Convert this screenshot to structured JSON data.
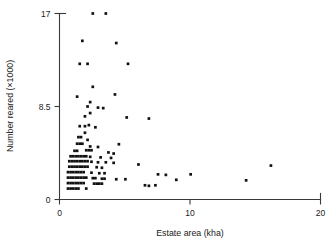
{
  "chart_data": {
    "type": "scatter",
    "title": "",
    "xlabel": "Estate area (kha)",
    "ylabel": "Number reared (×1000)",
    "xlim": [
      0,
      20
    ],
    "ylim": [
      0,
      17
    ],
    "xticks": [
      0,
      10,
      20
    ],
    "xticklabels": [
      "0",
      "10",
      "20"
    ],
    "yticks": [
      0,
      8.5,
      17
    ],
    "yticklabels": [
      "0",
      "8.5",
      "17"
    ],
    "grid": false,
    "legend": null,
    "marker": "square",
    "marker_color": "#111111",
    "points": [
      [
        2.55,
        17.0
      ],
      [
        3.55,
        17.0
      ],
      [
        1.75,
        14.5
      ],
      [
        4.35,
        14.3
      ],
      [
        1.55,
        12.4
      ],
      [
        2.15,
        12.4
      ],
      [
        5.25,
        12.4
      ],
      [
        2.55,
        10.3
      ],
      [
        1.35,
        9.4
      ],
      [
        4.25,
        9.6
      ],
      [
        2.35,
        8.9
      ],
      [
        2.15,
        8.5
      ],
      [
        2.95,
        8.4
      ],
      [
        3.35,
        8.35
      ],
      [
        2.35,
        7.9
      ],
      [
        1.95,
        7.6
      ],
      [
        5.15,
        7.5
      ],
      [
        6.85,
        7.4
      ],
      [
        1.55,
        6.7
      ],
      [
        1.95,
        6.7
      ],
      [
        2.25,
        6.8
      ],
      [
        2.75,
        6.6
      ],
      [
        1.95,
        6.1
      ],
      [
        1.45,
        5.7
      ],
      [
        1.65,
        5.7
      ],
      [
        2.15,
        5.45
      ],
      [
        1.35,
        5.1
      ],
      [
        1.55,
        5.1
      ],
      [
        1.75,
        5.1
      ],
      [
        4.55,
        5.05
      ],
      [
        2.35,
        4.85
      ],
      [
        2.95,
        4.8
      ],
      [
        1.15,
        4.45
      ],
      [
        1.35,
        4.45
      ],
      [
        2.05,
        4.5
      ],
      [
        2.25,
        4.5
      ],
      [
        2.45,
        4.5
      ],
      [
        3.75,
        4.3
      ],
      [
        4.15,
        4.2
      ],
      [
        0.85,
        3.95
      ],
      [
        1.05,
        3.95
      ],
      [
        1.25,
        3.95
      ],
      [
        1.45,
        3.95
      ],
      [
        1.65,
        3.95
      ],
      [
        1.85,
        3.95
      ],
      [
        2.05,
        3.95
      ],
      [
        2.35,
        3.9
      ],
      [
        3.15,
        3.85
      ],
      [
        3.95,
        3.8
      ],
      [
        0.75,
        3.5
      ],
      [
        0.95,
        3.5
      ],
      [
        1.15,
        3.5
      ],
      [
        1.35,
        3.5
      ],
      [
        1.55,
        3.5
      ],
      [
        1.75,
        3.5
      ],
      [
        1.95,
        3.5
      ],
      [
        2.15,
        3.5
      ],
      [
        2.45,
        3.45
      ],
      [
        2.95,
        3.4
      ],
      [
        3.55,
        3.4
      ],
      [
        4.15,
        3.35
      ],
      [
        6.05,
        3.2
      ],
      [
        0.75,
        3.0
      ],
      [
        0.95,
        3.0
      ],
      [
        1.15,
        3.0
      ],
      [
        1.35,
        3.0
      ],
      [
        1.55,
        3.0
      ],
      [
        1.75,
        3.0
      ],
      [
        1.95,
        3.0
      ],
      [
        2.15,
        3.0
      ],
      [
        2.85,
        2.95
      ],
      [
        3.25,
        2.9
      ],
      [
        16.2,
        3.1
      ],
      [
        0.65,
        2.5
      ],
      [
        0.85,
        2.5
      ],
      [
        1.05,
        2.5
      ],
      [
        1.25,
        2.5
      ],
      [
        1.45,
        2.5
      ],
      [
        1.65,
        2.5
      ],
      [
        1.85,
        2.5
      ],
      [
        2.45,
        2.45
      ],
      [
        3.05,
        2.4
      ],
      [
        3.45,
        2.4
      ],
      [
        7.55,
        2.3
      ],
      [
        8.15,
        2.25
      ],
      [
        10.05,
        2.3
      ],
      [
        0.65,
        2.0
      ],
      [
        0.85,
        2.0
      ],
      [
        1.05,
        2.0
      ],
      [
        1.25,
        2.0
      ],
      [
        1.45,
        2.0
      ],
      [
        1.65,
        2.0
      ],
      [
        1.85,
        2.0
      ],
      [
        2.05,
        2.0
      ],
      [
        2.55,
        1.95
      ],
      [
        2.75,
        1.95
      ],
      [
        3.25,
        1.9
      ],
      [
        3.45,
        1.9
      ],
      [
        4.35,
        1.85
      ],
      [
        5.05,
        1.85
      ],
      [
        8.95,
        1.8
      ],
      [
        14.3,
        1.75
      ],
      [
        0.65,
        1.5
      ],
      [
        0.85,
        1.5
      ],
      [
        1.05,
        1.5
      ],
      [
        1.25,
        1.5
      ],
      [
        1.45,
        1.5
      ],
      [
        1.65,
        1.5
      ],
      [
        1.85,
        1.5
      ],
      [
        2.65,
        1.45
      ],
      [
        2.85,
        1.45
      ],
      [
        3.05,
        1.45
      ],
      [
        3.25,
        1.45
      ],
      [
        6.55,
        1.3
      ],
      [
        6.85,
        1.25
      ],
      [
        7.35,
        1.3
      ],
      [
        0.65,
        1.0
      ],
      [
        0.85,
        1.0
      ],
      [
        1.05,
        1.0
      ],
      [
        1.25,
        1.0
      ],
      [
        1.45,
        1.0
      ],
      [
        2.05,
        1.0
      ]
    ]
  }
}
